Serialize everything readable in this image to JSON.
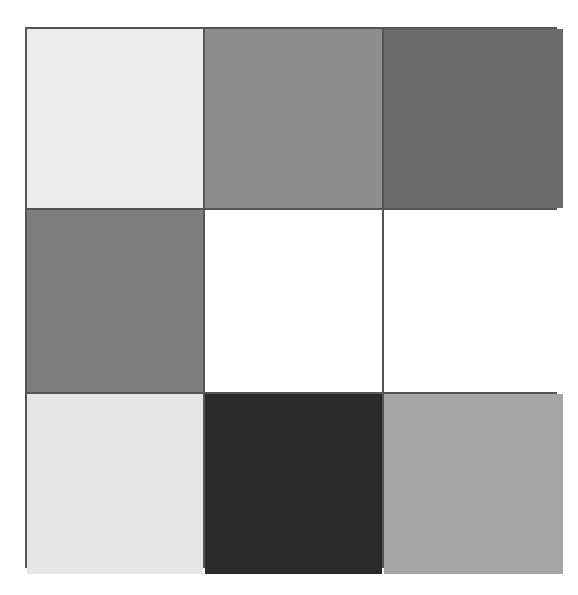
{
  "grid": {
    "rows": 3,
    "cols": 3,
    "border_color": "#555555",
    "cells": [
      {
        "row": 0,
        "col": 0,
        "shade": "light-gray",
        "color": "#ececec"
      },
      {
        "row": 0,
        "col": 1,
        "shade": "medium-gray",
        "color": "#8e8e8e"
      },
      {
        "row": 0,
        "col": 2,
        "shade": "dark-gray",
        "color": "#6a6a6a"
      },
      {
        "row": 1,
        "col": 0,
        "shade": "medium-dark-gray",
        "color": "#7e7e7e"
      },
      {
        "row": 1,
        "col": 1,
        "shade": "white",
        "color": "#ffffff"
      },
      {
        "row": 1,
        "col": 2,
        "shade": "white",
        "color": "#ffffff"
      },
      {
        "row": 2,
        "col": 0,
        "shade": "light-gray",
        "color": "#e6e6e6"
      },
      {
        "row": 2,
        "col": 1,
        "shade": "near-black",
        "color": "#2a2a2a"
      },
      {
        "row": 2,
        "col": 2,
        "shade": "silver-gray",
        "color": "#a6a6a6"
      }
    ]
  }
}
